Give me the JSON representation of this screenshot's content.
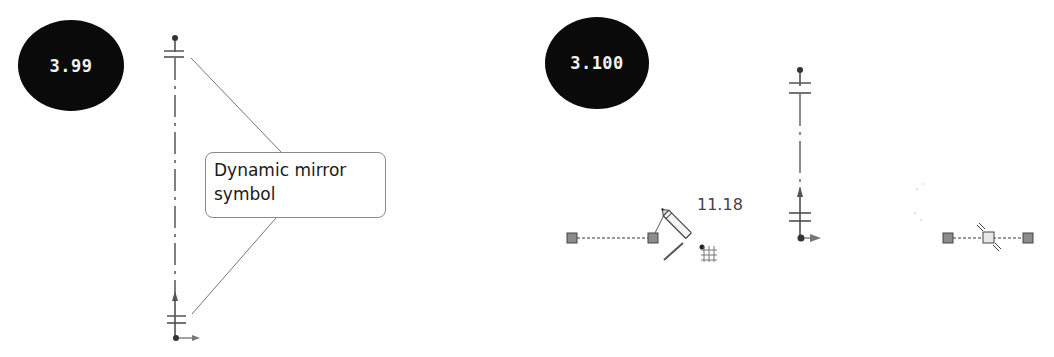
{
  "figures": [
    {
      "id": "left",
      "badge_label": "3.99",
      "callout_line1": "Dynamic mirror",
      "callout_line2": "symbol",
      "elements": [
        "mirror-axis-centerline",
        "mirror-symbol-top",
        "mirror-symbol-bottom",
        "leader-lines",
        "origin-arrow"
      ]
    },
    {
      "id": "right",
      "badge_label": "3.100",
      "dimension_value": "11.18",
      "elements": [
        "sketch-line-with-endpoints",
        "pencil-cursor",
        "grid-snap-icon",
        "mirror-axis-centerline",
        "mirrored-line-with-midpoint"
      ]
    }
  ],
  "colors": {
    "badge_bg": "#0a0a0a",
    "badge_text": "#f2f2f2",
    "line": "#555555",
    "endpoint_fill": "#8c8c8c",
    "callout_border": "#8a8a8a"
  }
}
